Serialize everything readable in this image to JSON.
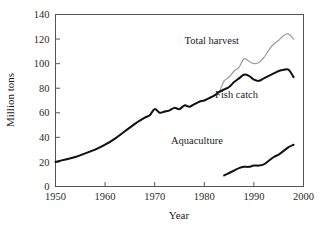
{
  "chart_data": {
    "type": "line",
    "title": "",
    "xlabel": "Year",
    "ylabel": "Million tons",
    "xlim": [
      1950,
      2000
    ],
    "ylim": [
      0,
      140
    ],
    "xticks": [
      1950,
      1960,
      1970,
      1980,
      1990,
      2000
    ],
    "xtick_labels": [
      "1950",
      "1960",
      "1970",
      "1980",
      "1990",
      "2000"
    ],
    "yticks": [
      0,
      20,
      40,
      60,
      80,
      100,
      120,
      140
    ],
    "ytick_labels": [
      "0",
      "20",
      "40",
      "60",
      "80",
      "100",
      "120",
      "140"
    ],
    "grid": false,
    "legend_position": "inline-annotations",
    "colors": {
      "total_harvest": "#9a9a9a",
      "fish_catch": "#111111",
      "aquaculture": "#111111",
      "axis": "#555555",
      "background": "#ffffff"
    },
    "series": [
      {
        "name": "Total harvest",
        "color": "#9a9a9a",
        "label_x": 1981.5,
        "label_y": 116,
        "x": [
          1950,
          1952,
          1954,
          1956,
          1958,
          1960,
          1962,
          1964,
          1966,
          1968,
          1969,
          1970,
          1971,
          1972,
          1973,
          1974,
          1975,
          1976,
          1977,
          1978,
          1979,
          1980,
          1981,
          1982,
          1983,
          1984,
          1985,
          1986,
          1987,
          1988,
          1989,
          1990,
          1991,
          1992,
          1993,
          1994,
          1995,
          1996,
          1997,
          1998
        ],
        "y": [
          20,
          22,
          24,
          27,
          30,
          34,
          39,
          45,
          51,
          56,
          58,
          63,
          60,
          61,
          62,
          64,
          63,
          66,
          65,
          67,
          69,
          70,
          72,
          74,
          77,
          86,
          89,
          94,
          97,
          104,
          102,
          100,
          101,
          105,
          111,
          116,
          119,
          123,
          124,
          120
        ]
      },
      {
        "name": "Fish catch",
        "color": "#111111",
        "label_x": 1986.5,
        "label_y": 72,
        "x": [
          1950,
          1952,
          1954,
          1956,
          1958,
          1960,
          1962,
          1964,
          1966,
          1968,
          1969,
          1970,
          1971,
          1972,
          1973,
          1974,
          1975,
          1976,
          1977,
          1978,
          1979,
          1980,
          1981,
          1982,
          1983,
          1984,
          1985,
          1986,
          1987,
          1988,
          1989,
          1990,
          1991,
          1992,
          1993,
          1994,
          1995,
          1996,
          1997,
          1998
        ],
        "y": [
          20,
          22,
          24,
          27,
          30,
          34,
          39,
          45,
          51,
          56,
          58,
          63,
          60,
          61,
          62,
          64,
          63,
          66,
          65,
          67,
          69,
          70,
          72,
          74,
          77,
          79,
          81,
          85,
          88,
          91,
          90,
          87,
          86,
          88,
          90,
          92,
          94,
          95,
          95,
          89
        ]
      },
      {
        "name": "Aquaculture",
        "color": "#111111",
        "label_x": 1978.5,
        "label_y": 35,
        "x": [
          1984,
          1985,
          1986,
          1987,
          1988,
          1989,
          1990,
          1991,
          1992,
          1993,
          1994,
          1995,
          1996,
          1997,
          1998
        ],
        "y": [
          9,
          11,
          13,
          15,
          16,
          16,
          17,
          17,
          18,
          21,
          24,
          26,
          29,
          32,
          34
        ]
      }
    ]
  }
}
